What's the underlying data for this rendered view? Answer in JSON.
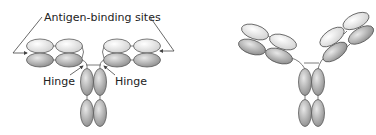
{
  "diagram": {
    "left_antibody": {
      "label_antigen_sites": "Antigen-binding sites",
      "label_hinge_left": "Hinge",
      "label_hinge_right": "Hinge"
    },
    "right_antibody": {
      "description": "flexed antibody (hinge bent)"
    },
    "colors": {
      "light_domain": "#e6e6e6",
      "dark_domain": "#a8a8a8",
      "stroke": "#5a5a5a",
      "text": "#222222"
    }
  }
}
